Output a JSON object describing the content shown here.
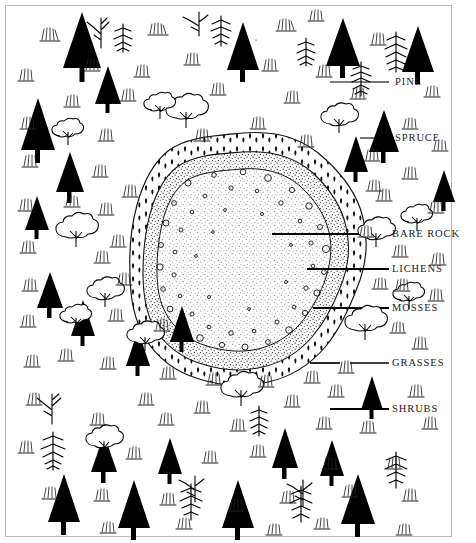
{
  "figure": {
    "type": "ecological-succession-diagram",
    "background_color": "#ffffff",
    "ink_color": "#000000",
    "width": 476,
    "height": 543
  },
  "legend": {
    "items": [
      {
        "key": "pine",
        "label": "PINE",
        "leader": "thin-rule",
        "symbol": "pine-tree-icon"
      },
      {
        "key": "spruce",
        "label": "SPRUCE",
        "leader": "thin-rule",
        "symbol": "spruce-tree-icon"
      },
      {
        "key": "bare_rock",
        "label": "BARE  ROCK",
        "leader": "thick-rule",
        "symbol": "bare-rock-zone"
      },
      {
        "key": "lichens",
        "label": "LICHENS",
        "leader": "thick-rule",
        "symbol": "lichen-zone"
      },
      {
        "key": "mosses",
        "label": "MOSSES",
        "leader": "thick-rule",
        "symbol": "moss-zone"
      },
      {
        "key": "grasses",
        "label": "GRASSES",
        "leader": "broken-rule",
        "symbol": "grass-tuft-icon"
      },
      {
        "key": "shrubs",
        "label": "SHRUBS",
        "leader": "thick-rule",
        "symbol": "shrub-icon"
      }
    ]
  },
  "zones": {
    "bare_rock": {
      "name": "Bare rock core",
      "texture": "fine-stipple"
    },
    "lichens": {
      "name": "Lichen ring",
      "texture": "open-circles-on-stipple"
    },
    "mosses": {
      "name": "Moss band",
      "texture": "dark-teardrop-marks"
    },
    "surround": {
      "name": "Forest surround",
      "texture": "trees-shrubs-grasses"
    }
  }
}
